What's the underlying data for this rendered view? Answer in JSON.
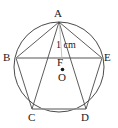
{
  "figure": {
    "stroke_color": "#4a4a4a",
    "text_color": "#1a1a1a",
    "background_color": "#ffffff",
    "circle": {
      "name": "circumscribed-circle",
      "cx": 59,
      "cy": 67,
      "r": 45
    },
    "center_point": {
      "name": "circle-center-dot",
      "cx": 62.5,
      "cy": 69.5,
      "r": 1.8
    },
    "vertices": [
      {
        "id": "A",
        "label": "A",
        "x": 59,
        "y": 22,
        "label_x": 54,
        "label_y": 8
      },
      {
        "id": "B",
        "label": "B",
        "x": 16,
        "y": 58,
        "label_x": 3,
        "label_y": 52
      },
      {
        "id": "C",
        "label": "C",
        "x": 32,
        "y": 109,
        "label_x": 28,
        "label_y": 112
      },
      {
        "id": "D",
        "label": "D",
        "x": 86,
        "y": 109,
        "label_x": 81,
        "label_y": 112
      },
      {
        "id": "E",
        "label": "E",
        "x": 102,
        "y": 58,
        "label_x": 104,
        "label_y": 52
      }
    ],
    "interior_points": [
      {
        "id": "F",
        "label": "F",
        "x": 62,
        "y": 62,
        "label_x": 57,
        "label_y": 57
      },
      {
        "id": "O",
        "label": "O",
        "x": 62.5,
        "y": 69.5,
        "label_x": 58,
        "label_y": 72
      }
    ],
    "pentagon_sides": [
      {
        "name": "side-AB",
        "from": "A",
        "to": "B"
      },
      {
        "name": "side-BC",
        "from": "B",
        "to": "C"
      },
      {
        "name": "side-CD",
        "from": "C",
        "to": "D"
      },
      {
        "name": "side-DE",
        "from": "D",
        "to": "E"
      },
      {
        "name": "side-EA",
        "from": "E",
        "to": "A"
      }
    ],
    "diagonals": [
      {
        "name": "diagonal-AC",
        "from": "A",
        "to": "C"
      },
      {
        "name": "diagonal-AD",
        "from": "A",
        "to": "D"
      },
      {
        "name": "diagonal-BE",
        "from": "B",
        "to": "E"
      }
    ],
    "measure": {
      "name": "segment-AF-length",
      "text": "1 cm",
      "label_x": 56,
      "label_y": 40,
      "from": "A",
      "to": "F",
      "leader": {
        "x1": 59.5,
        "y1": 24,
        "x2": 62,
        "y2": 60
      }
    }
  }
}
